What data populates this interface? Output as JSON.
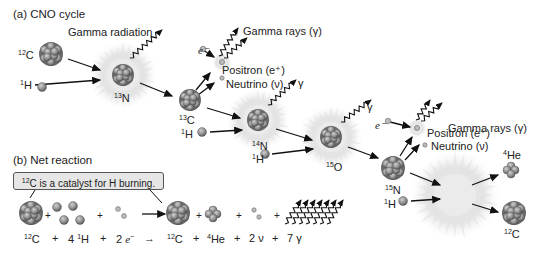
{
  "sections": {
    "a_title": "(a)  CNO cycle",
    "b_title": "(b)  Net reaction"
  },
  "labels": {
    "gamma_radiation": "Gamma radiation",
    "gamma_rays": "Gamma rays (γ)",
    "positron": "Positron (e⁺)",
    "neutrino": "Neutrino (ν)",
    "gamma": "γ",
    "electron": "e⁻"
  },
  "nuclei": {
    "c12": {
      "mass": "12",
      "sym": "C"
    },
    "h1": {
      "mass": "1",
      "sym": "H"
    },
    "n13": {
      "mass": "13",
      "sym": "N"
    },
    "c13": {
      "mass": "13",
      "sym": "C"
    },
    "n14": {
      "mass": "14",
      "sym": "N"
    },
    "o15": {
      "mass": "15",
      "sym": "O"
    },
    "n15": {
      "mass": "15",
      "sym": "N"
    },
    "he4": {
      "mass": "4",
      "sym": "He"
    }
  },
  "catalyst_note": "C is a catalyst for H burning.",
  "catalyst_mass": "12",
  "equation": {
    "terms": [
      "12C",
      "+",
      "4 1H",
      "+",
      "2 e⁻",
      "→",
      "12C",
      "+",
      "4He",
      "+",
      "2 ν",
      "+",
      "7 γ"
    ]
  }
}
